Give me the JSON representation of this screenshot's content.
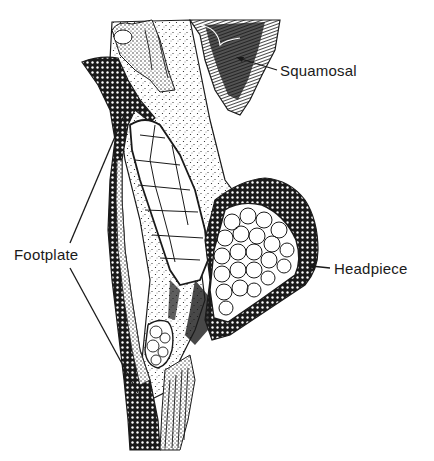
{
  "figure": {
    "type": "anatomical-section-diagram",
    "colors": {
      "background": "#ffffff",
      "ink": "#1a1a1a"
    },
    "labels": [
      {
        "id": "squamosal",
        "text": "Squamosal",
        "x": 280,
        "y": 60
      },
      {
        "id": "footplate",
        "text": "Footplate",
        "x": 12,
        "y": 243
      },
      {
        "id": "headpiece",
        "text": "Headpiece",
        "x": 334,
        "y": 260
      }
    ]
  }
}
